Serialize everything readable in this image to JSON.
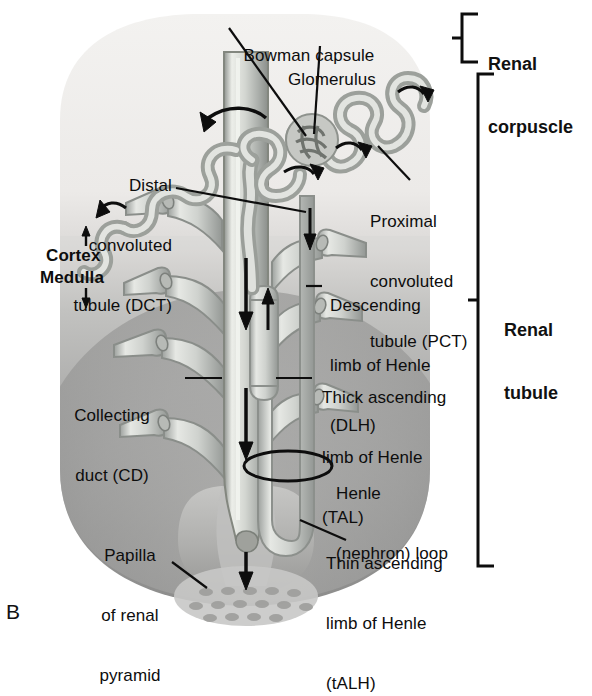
{
  "figure": {
    "letter": "B",
    "type": "anatomical-diagram"
  },
  "brackets": [
    {
      "id": "renal-corpuscle",
      "label_line1": "Renal",
      "label_line2": "corpuscle"
    },
    {
      "id": "renal-tubule",
      "label_line1": "Renal",
      "label_line2": "tubule"
    }
  ],
  "zones": [
    {
      "id": "cortex",
      "label": "Cortex",
      "arrow": "↑"
    },
    {
      "id": "medulla",
      "label": "Medulla",
      "arrow": "↓"
    }
  ],
  "labels": [
    {
      "id": "bowman-capsule",
      "lines": [
        "Bowman capsule"
      ]
    },
    {
      "id": "glomerulus",
      "lines": [
        "Glomerulus"
      ]
    },
    {
      "id": "distal-convoluted-tubule",
      "lines": [
        "Distal",
        "convoluted",
        "tubule (DCT)"
      ]
    },
    {
      "id": "proximal-convoluted-tubule",
      "lines": [
        "Proximal",
        "convoluted",
        "tubule (PCT)"
      ]
    },
    {
      "id": "descending-limb-of-henle",
      "lines": [
        "Descending",
        "limb of Henle",
        "(DLH)"
      ]
    },
    {
      "id": "thick-ascending-limb-of-henle",
      "lines": [
        "Thick ascending",
        "limb of Henle",
        "(TAL)"
      ]
    },
    {
      "id": "henle-nephron-loop",
      "lines": [
        "Henle",
        "(nephron) loop"
      ]
    },
    {
      "id": "thin-ascending-limb-of-henle",
      "lines": [
        "Thin ascending",
        "limb of Henle",
        "(tALH)"
      ]
    },
    {
      "id": "collecting-duct",
      "lines": [
        "Collecting",
        "duct (CD)"
      ]
    },
    {
      "id": "papilla-of-renal-pyramid",
      "lines": [
        "Papilla",
        "of renal",
        "pyramid"
      ]
    }
  ],
  "colors": {
    "background": "#ffffff",
    "cortex_tissue": "#efeeec",
    "medulla_tissue": "#9a9a9a",
    "tubule_wall": "#8f9391",
    "tubule_fill": "#d9dbd6",
    "line": "#111111",
    "text": "#0d0d0d"
  }
}
